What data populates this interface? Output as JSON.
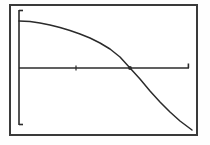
{
  "window": {
    "title": "Graph Plot",
    "background_color": "#ffffff",
    "frame_color": "#3a3a3a",
    "frame_rect": {
      "x": 9,
      "y": 4,
      "width": 189,
      "height": 132
    }
  },
  "chart_data": {
    "type": "line",
    "title": "",
    "subtitle": "",
    "xlabel": "",
    "ylabel": "",
    "grid": false,
    "legend": null,
    "axis_color": "#2b2b2b",
    "curve_color": "#2b2b2b",
    "xlim": [
      0,
      10
    ],
    "ylim": [
      -6,
      4
    ],
    "x_axis": {
      "label": "x-axis",
      "pixel_y": 68,
      "pixel_x_start": 19,
      "pixel_x_end": 189,
      "end_tick": true,
      "ticks": [
        {
          "label": "",
          "pixel_x": 76
        }
      ]
    },
    "y_axis": {
      "label": "y-axis",
      "pixel_x": 19,
      "pixel_y_start": 10,
      "pixel_y_end": 125,
      "end_ticks": true,
      "ticks": []
    },
    "x_intercept": {
      "pixel_x": 130,
      "pixel_y": 68
    },
    "series": [
      {
        "name": "curve",
        "description": "downward-opening parabola",
        "points": [
          {
            "x": 19,
            "y": 21
          },
          {
            "x": 30,
            "y": 21.5
          },
          {
            "x": 40,
            "y": 23
          },
          {
            "x": 50,
            "y": 25
          },
          {
            "x": 60,
            "y": 27.5
          },
          {
            "x": 70,
            "y": 30.5
          },
          {
            "x": 80,
            "y": 34
          },
          {
            "x": 90,
            "y": 38
          },
          {
            "x": 100,
            "y": 43
          },
          {
            "x": 110,
            "y": 49
          },
          {
            "x": 120,
            "y": 57
          },
          {
            "x": 130,
            "y": 68
          },
          {
            "x": 140,
            "y": 79
          },
          {
            "x": 150,
            "y": 91
          },
          {
            "x": 160,
            "y": 102
          },
          {
            "x": 170,
            "y": 112
          },
          {
            "x": 180,
            "y": 121
          },
          {
            "x": 192,
            "y": 130
          }
        ]
      }
    ]
  }
}
